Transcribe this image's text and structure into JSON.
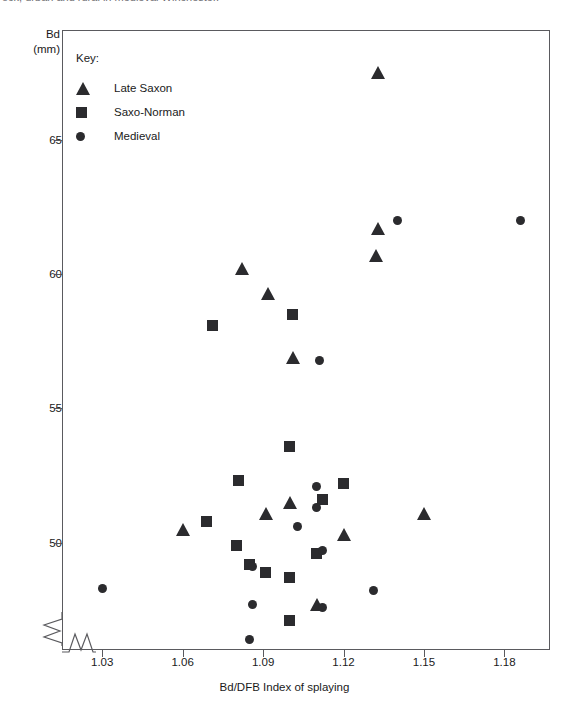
{
  "caption": {
    "text": "ock, urban and rural in medieval Winchester."
  },
  "chart_data": {
    "type": "scatter",
    "title": "",
    "xlabel": "Bd/DFB Index of splaying",
    "ylabel": "Bd",
    "ylabel_unit": "(mm)",
    "xlim": [
      1.015,
      1.197
    ],
    "ylim": [
      46.0,
      69.1
    ],
    "xticks": [
      "1.03",
      "1.06",
      "1.09",
      "1.12",
      "1.15",
      "1.18"
    ],
    "xtick_values": [
      1.03,
      1.06,
      1.09,
      1.12,
      1.15,
      1.18
    ],
    "yticks": [
      "65",
      "60",
      "55",
      "50"
    ],
    "ytick_values": [
      65,
      60,
      55,
      50
    ],
    "grid": false,
    "axis_break_x": true,
    "axis_break_y": true,
    "legend_position": "top-left",
    "legend_title": "Key:",
    "marker_color": "#2b2b2e",
    "series": [
      {
        "name": "Late Saxon",
        "marker": "triangle",
        "points": [
          {
            "x": 1.133,
            "y": 67.5
          },
          {
            "x": 1.133,
            "y": 61.7
          },
          {
            "x": 1.132,
            "y": 60.7
          },
          {
            "x": 1.082,
            "y": 60.2
          },
          {
            "x": 1.092,
            "y": 59.3
          },
          {
            "x": 1.101,
            "y": 56.9
          },
          {
            "x": 1.1,
            "y": 51.5
          },
          {
            "x": 1.091,
            "y": 51.1
          },
          {
            "x": 1.06,
            "y": 50.5
          },
          {
            "x": 1.12,
            "y": 50.3
          },
          {
            "x": 1.15,
            "y": 51.1
          },
          {
            "x": 1.11,
            "y": 47.7
          }
        ]
      },
      {
        "name": "Saxo-Norman",
        "marker": "square",
        "points": [
          {
            "x": 1.071,
            "y": 58.1
          },
          {
            "x": 1.101,
            "y": 58.5
          },
          {
            "x": 1.1,
            "y": 53.6
          },
          {
            "x": 1.081,
            "y": 52.3
          },
          {
            "x": 1.12,
            "y": 52.2
          },
          {
            "x": 1.069,
            "y": 50.8
          },
          {
            "x": 1.08,
            "y": 49.9
          },
          {
            "x": 1.085,
            "y": 49.2
          },
          {
            "x": 1.091,
            "y": 48.9
          },
          {
            "x": 1.1,
            "y": 48.7
          },
          {
            "x": 1.11,
            "y": 49.6
          },
          {
            "x": 1.112,
            "y": 51.6
          },
          {
            "x": 1.1,
            "y": 47.1
          }
        ]
      },
      {
        "name": "Medieval",
        "marker": "circle",
        "points": [
          {
            "x": 1.14,
            "y": 62.0
          },
          {
            "x": 1.186,
            "y": 62.0
          },
          {
            "x": 1.111,
            "y": 56.8
          },
          {
            "x": 1.11,
            "y": 52.1
          },
          {
            "x": 1.11,
            "y": 51.3
          },
          {
            "x": 1.103,
            "y": 50.6
          },
          {
            "x": 1.112,
            "y": 49.7
          },
          {
            "x": 1.086,
            "y": 49.1
          },
          {
            "x": 1.03,
            "y": 48.3
          },
          {
            "x": 1.131,
            "y": 48.2
          },
          {
            "x": 1.086,
            "y": 47.7
          },
          {
            "x": 1.112,
            "y": 47.6
          },
          {
            "x": 1.085,
            "y": 46.4
          }
        ]
      }
    ]
  }
}
